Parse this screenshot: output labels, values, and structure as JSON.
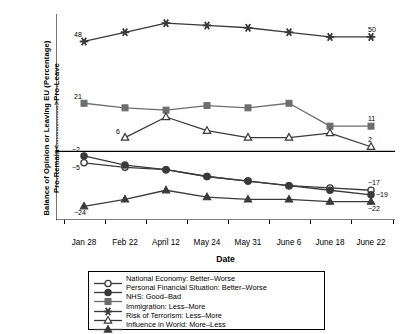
{
  "chart_data": {
    "type": "line",
    "title": "",
    "xlabel": "Date",
    "ylabel": "Balance of Opinion or Leaving EU (Percentage)",
    "ylabel2": "Pro-Remain<--------------->Pro-Leave",
    "categories": [
      "Jan 28",
      "Feb 22",
      "April 12",
      "May 24",
      "May 31",
      "June 6",
      "June 18",
      "June 22"
    ],
    "ylim": [
      -30,
      60
    ],
    "yticks": [
      60,
      50,
      40,
      30,
      20,
      10,
      0,
      -10,
      -20,
      -30
    ],
    "grid": false,
    "legend_position": "below-center",
    "zero_line": true,
    "series": [
      {
        "name": "National Economy: Better–Worse",
        "marker": "open-circle",
        "values": [
          -5,
          -7,
          -8,
          -11,
          -13,
          -15,
          -16,
          -17
        ],
        "labels": [
          {
            "index": 0,
            "text": "−5"
          },
          {
            "index": 7,
            "text": "−17"
          }
        ]
      },
      {
        "name": "Personal Financial Situation: Better–Worse",
        "marker": "filled-circle",
        "values": [
          -2,
          -6,
          -8,
          -11,
          -13,
          -15,
          -17,
          -19
        ],
        "labels": [
          {
            "index": 0,
            "text": "−2"
          },
          {
            "index": 7,
            "text": "−19"
          }
        ]
      },
      {
        "name": "NHS: Good–Bad",
        "marker": "filled-square",
        "values": [
          21,
          19,
          18,
          20,
          19,
          21,
          11,
          11
        ],
        "labels": [
          {
            "index": 0,
            "text": "21"
          },
          {
            "index": 7,
            "text": "11"
          }
        ]
      },
      {
        "name": "Immigration: Less–More",
        "marker": "asterisk",
        "values": [
          48,
          52,
          56,
          55,
          54,
          52,
          50,
          50
        ],
        "labels": [
          {
            "index": 0,
            "text": "48"
          },
          {
            "index": 7,
            "text": "50"
          }
        ]
      },
      {
        "name": "Risk of Terrorism: Less–More",
        "marker": "open-triangle",
        "values": [
          null,
          6,
          15,
          9,
          6,
          6,
          8,
          2
        ],
        "labels": [
          {
            "index": 1,
            "text": "6"
          },
          {
            "index": 7,
            "text": "2"
          }
        ]
      },
      {
        "name": "Influence in World: More–Less",
        "marker": "filled-triangle",
        "values": [
          -24,
          -21,
          -17,
          -20,
          -21,
          -21,
          -22,
          -22
        ],
        "labels": [
          {
            "index": 0,
            "text": "−24"
          },
          {
            "index": 7,
            "text": "−22"
          }
        ]
      }
    ]
  },
  "legend": {
    "items": [
      "National Economy: Better–Worse",
      "Personal Financial Situation: Better–Worse",
      "NHS: Good–Bad",
      "Immigration: Less–More",
      "Risk of Terrorism: Less–More",
      "Influence in World: More–Less"
    ]
  },
  "axis": {
    "y_title_line1": "Balance of Opinion or Leaving EU (Percentage)",
    "y_title_line2": "Pro-Remain<--------------->Pro-Leave",
    "x_title": "Date"
  },
  "colors": {
    "line_dark": "#3a3a3a",
    "line_mid": "#6e6e6e",
    "axis": "#000000",
    "background": "#ffffff"
  }
}
